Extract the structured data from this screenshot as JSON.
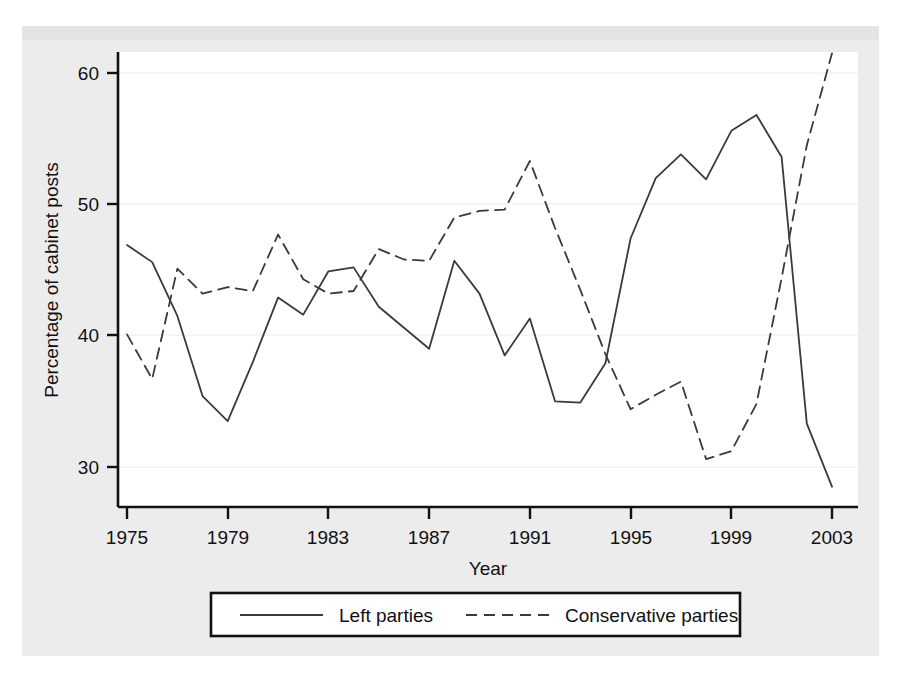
{
  "figure": {
    "plot_background": "#ffffff",
    "page_background": "#ececed",
    "line_color": "#3a3a3a",
    "axis_color": "#111111"
  },
  "axes": {
    "y_title": "Percentage of cabinet posts",
    "x_title": "Year",
    "y_ticks": [
      "30",
      "40",
      "50",
      "60"
    ],
    "x_ticks": [
      "1975",
      "1979",
      "1983",
      "1987",
      "1991",
      "1995",
      "1999",
      "2003"
    ]
  },
  "legend": {
    "items": [
      {
        "label": "Left parties",
        "style": "solid"
      },
      {
        "label": "Conservative parties",
        "style": "dashed"
      }
    ]
  },
  "chart_data": {
    "type": "line",
    "title": "",
    "xlabel": "Year",
    "ylabel": "Percentage of cabinet posts",
    "xlim": [
      1975,
      2003
    ],
    "ylim": [
      28,
      62
    ],
    "y_ticks": [
      30,
      40,
      50,
      60
    ],
    "x_ticks": [
      1975,
      1979,
      1983,
      1987,
      1991,
      1995,
      1999,
      2003
    ],
    "grid": "horizontal-faint",
    "legend_position": "below-axis",
    "x": [
      1975,
      1976,
      1977,
      1978,
      1979,
      1980,
      1981,
      1982,
      1983,
      1984,
      1985,
      1986,
      1987,
      1988,
      1989,
      1990,
      1991,
      1992,
      1993,
      1994,
      1995,
      1996,
      1997,
      1998,
      1999,
      2000,
      2001,
      2002,
      2003
    ],
    "series": [
      {
        "name": "Left parties",
        "style": "solid",
        "values": [
          46.9,
          45.6,
          41.5,
          35.4,
          33.5,
          38.0,
          42.9,
          41.6,
          44.9,
          45.2,
          42.2,
          40.6,
          39.0,
          45.7,
          43.2,
          38.5,
          41.3,
          35.0,
          34.9,
          37.9,
          47.4,
          52.0,
          53.8,
          51.9,
          55.6,
          56.8,
          53.6,
          33.3,
          28.5
        ]
      },
      {
        "name": "Conservative parties",
        "style": "dashed",
        "values": [
          40.1,
          36.7,
          45.1,
          43.2,
          43.7,
          43.4,
          47.7,
          44.3,
          43.2,
          43.4,
          46.6,
          45.8,
          45.7,
          49.0,
          49.5,
          49.6,
          53.3,
          48.2,
          43.5,
          38.6,
          34.4,
          35.5,
          36.5,
          30.6,
          31.2,
          34.8,
          44.4,
          54.5,
          61.5
        ]
      }
    ]
  }
}
